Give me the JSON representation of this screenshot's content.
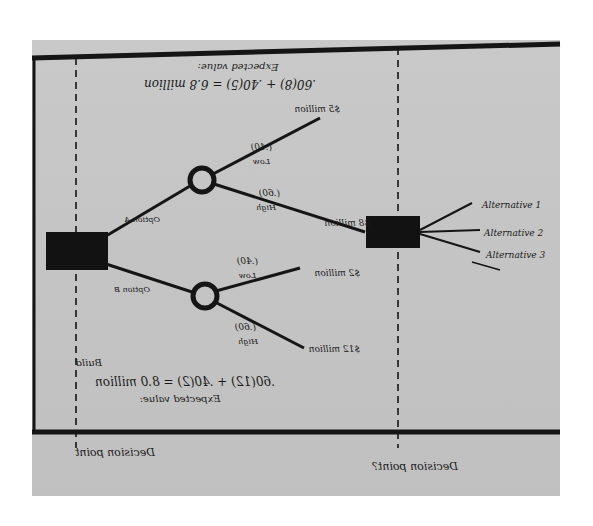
{
  "diagram": {
    "type": "decision-tree",
    "orientation_note": "handwritten photo; annotation text appears mirrored/upside-down",
    "colors": {
      "background": "#c4c4c4",
      "ink": "#1a1a1a",
      "page": "#ffffff"
    },
    "upper_annotation": {
      "label": "Expected value:",
      "equation": ".60(8) + .40(5) = 6.8 million"
    },
    "lower_annotation": {
      "label": "Expected value:",
      "equation": ".60(12) + .40(2) = 8.0 million",
      "tag": "Build"
    },
    "decision_node_left": {
      "branches": [
        "Option A",
        "Option B"
      ]
    },
    "chance_node_upper": {
      "branches": [
        {
          "label": "Low",
          "probability": "(.40)",
          "outcome": "$5 million"
        },
        {
          "label": "High",
          "probability": "(.60)",
          "outcome": "$8 million"
        }
      ]
    },
    "chance_node_lower": {
      "branches": [
        {
          "label": "Low",
          "probability": "(.40)",
          "outcome": "$2 million"
        },
        {
          "label": "High",
          "probability": "(.60)",
          "outcome": "$12 million"
        }
      ]
    },
    "decision_node_right": {
      "branches": [
        "Alternative 1",
        "Alternative 2",
        "Alternative 3"
      ]
    },
    "timeline": {
      "left_label": "Decision point",
      "right_label": "Decision point?"
    }
  }
}
